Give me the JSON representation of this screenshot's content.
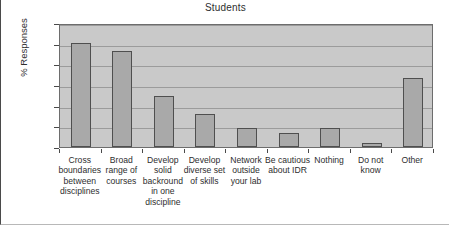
{
  "chart_data": {
    "type": "bar",
    "title": "Students",
    "xlabel": "",
    "ylabel": "% Responses",
    "ylim": [
      0.0,
      30.0
    ],
    "ytick_step": 5.0,
    "ytick_labels": [
      "0.0",
      "5.0",
      "10.0",
      "15.0",
      "20.0",
      "25.0",
      "30.0"
    ],
    "ytick_values": [
      0.0,
      5.0,
      10.0,
      15.0,
      20.0,
      25.0,
      30.0
    ],
    "grid": true,
    "legend": false,
    "categories": [
      "Cross\nboundaries\nbetween\ndisciplines",
      "Broad\nrange of\ncourses",
      "Develop\nsolid\nbackround\nin one\ndiscipline",
      "Develop\ndiverse set\nof skills",
      "Network\noutside\nyour lab",
      "Be cautious\nabout IDR",
      "Nothing",
      "Do not\nknow",
      "Other"
    ],
    "values": [
      25.2,
      23.3,
      12.3,
      8.1,
      4.7,
      3.4,
      4.6,
      1.0,
      16.8
    ],
    "colors": {
      "bar_fill": "#a9a9a9",
      "bar_edge": "#4f4f4f",
      "plot_background": "#c9c9c9",
      "gridline": "#9b9b9b",
      "text": "#2e2e2e",
      "figure_background": "#ffffff"
    }
  }
}
